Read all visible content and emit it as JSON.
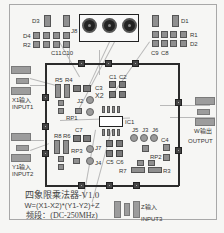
{
  "board": {
    "components": {
      "D3": "D3",
      "D4": "D4",
      "R2": "R2",
      "C11": "C11",
      "C10": "C10",
      "J8": "J8",
      "D1": "D1",
      "R1": "R1",
      "D2": "D2",
      "C9": "C9",
      "C8": "C8",
      "R5": "R5",
      "R4": "R4",
      "C1": "C1",
      "C2": "C2",
      "C3": "C3",
      "X2": "X2",
      "J2": "J2",
      "RP1": "RP1",
      "IC1": "IC1",
      "J5": "J5",
      "J3": "J3",
      "J6": "J6",
      "C4": "C4",
      "R8": "R8",
      "R6": "R6",
      "C7": "C7",
      "RP3": "RP3",
      "J7": "J7",
      "J4": "J4",
      "C5": "C5",
      "C6": "C6",
      "RP2": "RP2",
      "R7": "R7",
      "R3": "R3"
    },
    "ports": {
      "input1_cn": "X1输入",
      "input1": "INPUT1",
      "input2_cn": "Y1输入",
      "input2": "INPUT2",
      "output_cn": "W输出",
      "output": "OUTPUT",
      "input3_cn": "Z输入",
      "input3": "INPUT3"
    },
    "title": {
      "line1": "四象限乘法器-V1.0",
      "line2": "W=(X1-X2)*(Y1-Y2)+Z",
      "line3": "频段：(DC-250MHz)"
    }
  }
}
